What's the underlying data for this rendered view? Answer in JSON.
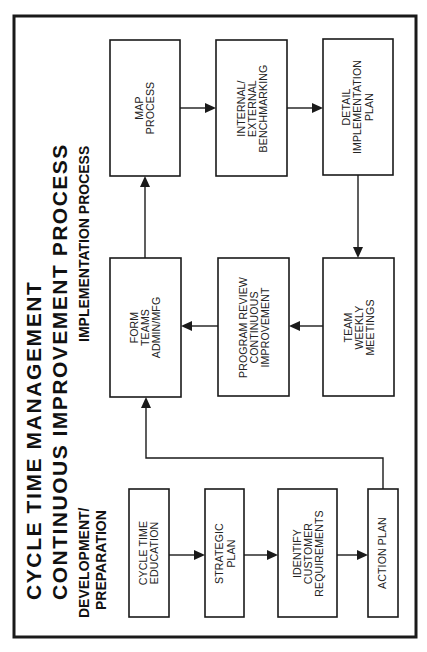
{
  "title": {
    "line1": "CYCLE  TIME  MANAGEMENT",
    "line2": "CONTINUOUS  IMPROVEMENT  PROCESS"
  },
  "sections": {
    "implementation": "IMPLEMENTATION PROCESS",
    "development_line1": "DEVELOPMENT/",
    "development_line2": "PREPARATION"
  },
  "implementation_boxes": [
    {
      "id": "map-process",
      "label": "MAP\nPROCESS"
    },
    {
      "id": "benchmarking",
      "label": "INTERNAL/\nEXTERNAL\nBENCHMARKING"
    },
    {
      "id": "detail-plan",
      "label": "DETAIL\nIMPLEMENTATION\nPLAN"
    },
    {
      "id": "form-teams",
      "label": "FORM\nTEAMS\nADMIN/MFG"
    },
    {
      "id": "program-review",
      "label": "PROGRAM REVIEW\nCONTINUOUS\nIMPROVEMENT"
    },
    {
      "id": "team-meetings",
      "label": "TEAM\nWEEKLY\nMEETINGS"
    }
  ],
  "development_boxes": [
    {
      "id": "cycle-time-education",
      "label": "CYCLE TIME\nEDUCATION"
    },
    {
      "id": "strategic-plan",
      "label": "STRATEGIC\nPLAN"
    },
    {
      "id": "identify-requirements",
      "label": "IDENTIFY\nCUSTOMER\nREQUIREMENTS"
    },
    {
      "id": "action-plan",
      "label": "ACTION PLAN"
    }
  ],
  "flow": [
    [
      "CYCLE TIME EDUCATION",
      "STRATEGIC PLAN"
    ],
    [
      "STRATEGIC PLAN",
      "IDENTIFY CUSTOMER REQUIREMENTS"
    ],
    [
      "IDENTIFY CUSTOMER REQUIREMENTS",
      "ACTION PLAN"
    ],
    [
      "ACTION PLAN",
      "FORM TEAMS ADMIN/MFG"
    ],
    [
      "FORM TEAMS ADMIN/MFG",
      "MAP PROCESS"
    ],
    [
      "MAP PROCESS",
      "INTERNAL/EXTERNAL BENCHMARKING"
    ],
    [
      "INTERNAL/EXTERNAL BENCHMARKING",
      "DETAIL IMPLEMENTATION PLAN"
    ],
    [
      "DETAIL IMPLEMENTATION PLAN",
      "TEAM WEEKLY MEETINGS"
    ],
    [
      "TEAM WEEKLY MEETINGS",
      "PROGRAM REVIEW CONTINUOUS IMPROVEMENT"
    ],
    [
      "PROGRAM REVIEW CONTINUOUS IMPROVEMENT",
      "FORM TEAMS ADMIN/MFG"
    ]
  ],
  "colors": {
    "ink": "#1a1a1a",
    "background": "#ffffff"
  }
}
